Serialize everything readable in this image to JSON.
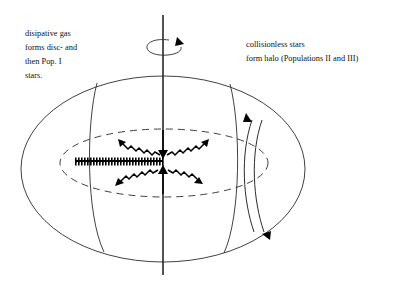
{
  "figure": {
    "background_color": "#ffffff",
    "line_color": "#2b2b2b",
    "text_color": "#111111"
  },
  "annotations": {
    "left": {
      "name": "dissipative-gas-note",
      "lines": [
        "disipative gas",
        "forms disc- and",
        "then Pop. I",
        "stars."
      ]
    },
    "right": {
      "name": "collisionless-stars-note",
      "lines": [
        "collisionless stars",
        "form halo (Populations II and III)"
      ]
    }
  },
  "elements": {
    "rotation_axis": {
      "label": "rotation-axis",
      "x": 163,
      "y_top": 15,
      "y_bottom": 275
    },
    "rotation_arrow": {
      "label": "rotation-direction-arrow",
      "cx": 163,
      "cy": 46,
      "rx": 16,
      "ry": 6
    },
    "outer_halo": {
      "label": "halo-outer-ellipse",
      "cx": 163,
      "cy": 169,
      "rx": 142,
      "ry": 93
    },
    "inner_disc_ellipse": {
      "label": "disc-plane-dashed-ellipse",
      "cx": 164,
      "cy": 163,
      "rx": 104,
      "ry": 34
    },
    "disc_bar": {
      "label": "gas-disc-bar",
      "x1": 75,
      "x2": 163,
      "y": 161
    },
    "gas_inflow_arrows": {
      "label": "gas-infall-arrows",
      "count": 6,
      "style": "zig-zag double-sided",
      "directions": [
        "upper-left",
        "top",
        "upper-right",
        "lower-left",
        "bottom",
        "lower-right"
      ]
    },
    "halo_orbit": {
      "label": "halo-star-orbit",
      "arrowheads": [
        "top",
        "bottom"
      ]
    },
    "meridian_left": {
      "label": "meridian-line-left"
    },
    "meridian_right": {
      "label": "meridian-line-right"
    }
  }
}
